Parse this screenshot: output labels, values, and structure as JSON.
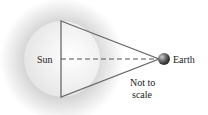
{
  "diagram": {
    "labels": {
      "sun": "Sun",
      "earth": "Earth",
      "note_line1": "Not to",
      "note_line2": "scale"
    },
    "colors": {
      "halo": "#9a9a9a",
      "sun_disc": "#f2f2f2",
      "lines": "#666666",
      "earth": "#555555",
      "text": "#222222"
    }
  }
}
